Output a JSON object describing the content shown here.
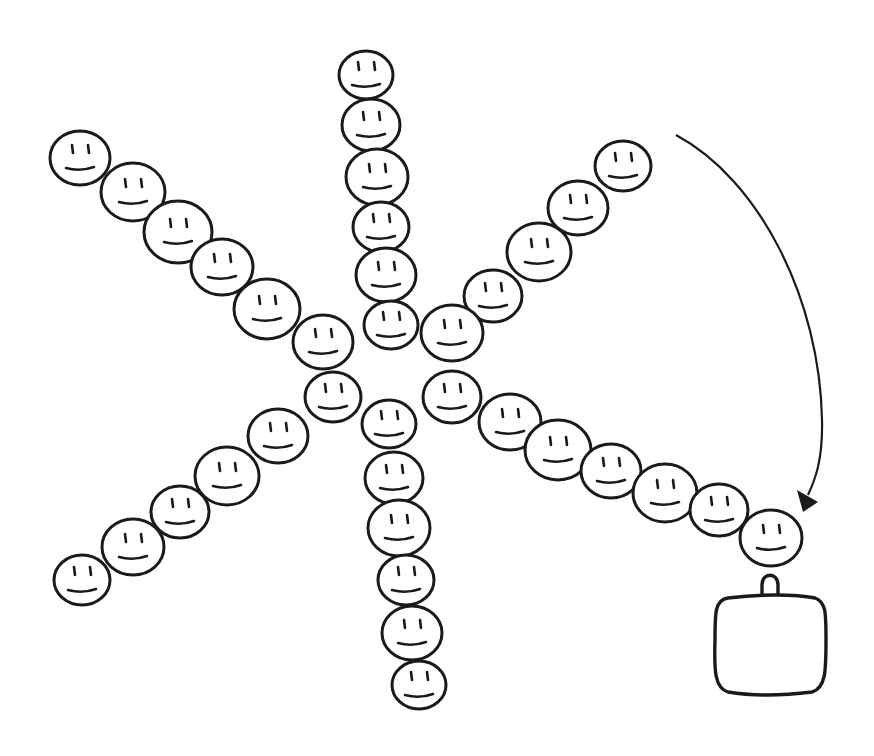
{
  "diagram": {
    "arms": [
      {
        "name": "up",
        "face_count": 6
      },
      {
        "name": "upper-left",
        "face_count": 6
      },
      {
        "name": "upper-right",
        "face_count": 5
      },
      {
        "name": "lower-right",
        "face_count": 8
      },
      {
        "name": "down",
        "face_count": 6
      },
      {
        "name": "lower-left",
        "face_count": 6
      }
    ],
    "arrow": {
      "from": "top-right",
      "to": "end of lower-right arm"
    },
    "container": {
      "shape": "rounded square",
      "handle": "loop on top"
    },
    "stroke_color": "#1a1a1a",
    "background_color": "#ffffff"
  }
}
